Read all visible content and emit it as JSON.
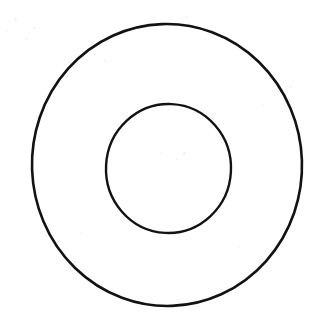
{
  "figure": {
    "title": "Concentric circles (annulus / washer outline)",
    "background_color": "#ffffff",
    "stroke_color": "#121212",
    "canvas": {
      "width": 330,
      "height": 328
    },
    "shapes": [
      {
        "name": "outer-circle",
        "kind": "ellipse",
        "cx": 167,
        "cy": 165,
        "rx": 135,
        "ry": 141,
        "stroke_width": 2.6,
        "fill": "none",
        "label": "Outer circle"
      },
      {
        "name": "inner-circle",
        "kind": "ellipse",
        "cx": 168.5,
        "cy": 168.5,
        "rx": 62.5,
        "ry": 64.5,
        "stroke_width": 2.4,
        "fill": "none",
        "label": "Inner circle"
      }
    ],
    "specks": [
      {
        "x": 186,
        "y": 16,
        "size": 2
      },
      {
        "x": 14,
        "y": 18,
        "size": 3
      },
      {
        "x": 6,
        "y": 30,
        "size": 2
      },
      {
        "x": 33,
        "y": 27,
        "size": 2
      },
      {
        "x": 26,
        "y": 38,
        "size": 2
      },
      {
        "x": 160,
        "y": 152,
        "size": 2
      },
      {
        "x": 176,
        "y": 158,
        "size": 2
      },
      {
        "x": 183,
        "y": 152,
        "size": 3
      },
      {
        "x": 262,
        "y": 104,
        "size": 2
      },
      {
        "x": 290,
        "y": 86,
        "size": 2
      },
      {
        "x": 80,
        "y": 232,
        "size": 2
      },
      {
        "x": 238,
        "y": 246,
        "size": 2
      },
      {
        "x": 104,
        "y": 60,
        "size": 2
      }
    ]
  }
}
